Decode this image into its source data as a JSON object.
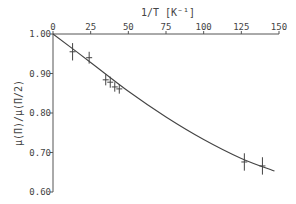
{
  "chart_data": {
    "type": "scatter",
    "title": "",
    "xlabel": "1/T [K⁻¹]",
    "ylabel": "μ(T)/μ(T/2)",
    "xlim": [
      0,
      150
    ],
    "ylim": [
      0.6,
      1.0
    ],
    "x_ticks": [
      "0",
      "25",
      "50",
      "75",
      "100",
      "125",
      "150"
    ],
    "y_ticks": [
      "1.00",
      "0.90",
      "0.80",
      "0.70",
      "0.60"
    ],
    "grid": false,
    "legend": null,
    "x_axis_position": "top",
    "series": [
      {
        "name": "measured",
        "points": [
          {
            "x": 13,
            "y": 0.955,
            "yerr": 0.022
          },
          {
            "x": 24,
            "y": 0.94,
            "yerr": 0.015
          },
          {
            "x": 35,
            "y": 0.884,
            "yerr": 0.014
          },
          {
            "x": 38,
            "y": 0.878,
            "yerr": 0.014
          },
          {
            "x": 41,
            "y": 0.866,
            "yerr": 0.012
          },
          {
            "x": 44,
            "y": 0.861,
            "yerr": 0.012
          },
          {
            "x": 127,
            "y": 0.676,
            "yerr": 0.022
          },
          {
            "x": 139,
            "y": 0.666,
            "yerr": 0.022
          }
        ]
      },
      {
        "name": "fit",
        "type": "line",
        "x": [
          0,
          25,
          50,
          75,
          100,
          125,
          147
        ],
        "y": [
          1.0,
          0.928,
          0.855,
          0.79,
          0.733,
          0.685,
          0.653
        ]
      }
    ]
  },
  "axes": {
    "xlabel_text": "1/T [K⁻¹]",
    "ylabel_text": "μ(Π)/μ(Π/2)"
  }
}
